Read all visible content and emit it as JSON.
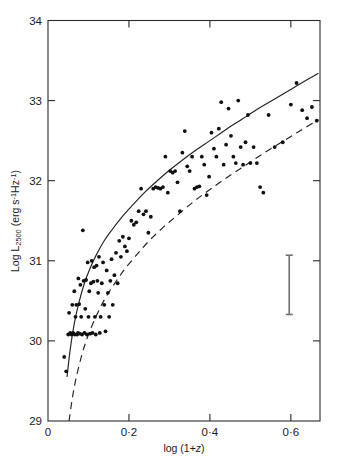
{
  "chart_data": {
    "type": "scatter",
    "title": "",
    "xlabel": "log (1+z)",
    "ylabel": "Log L_2500 (erg s^-1 Hz^-1)",
    "xlabel_parts": {
      "prefix": "log (1+",
      "italic": "z",
      "suffix": ")"
    },
    "ylabel_parts": {
      "lead": "Log L",
      "subscript": "2500",
      "open": " (erg s",
      "exp1": "-1",
      "mid": "Hz",
      "exp2": "-1",
      "close": ")"
    },
    "xlim": [
      0.0,
      0.672
    ],
    "ylim": [
      29.0,
      34.0
    ],
    "xticks": [
      0.0,
      0.2,
      0.4,
      0.6
    ],
    "xticklabels": [
      "0",
      "0·2",
      "0·4",
      "0·6"
    ],
    "yticks": [
      29,
      30,
      31,
      32,
      33,
      34
    ],
    "yticklabels": [
      "29",
      "30",
      "31",
      "32",
      "33",
      "34"
    ],
    "grid": false,
    "legend_position": "none",
    "tick_direction": "in",
    "axes_box": true,
    "point_marker": "filled-circle",
    "point_radius_px": 1.9,
    "series": [
      {
        "name": "quasar sample",
        "x": [
          0.04,
          0.045,
          0.05,
          0.052,
          0.055,
          0.058,
          0.06,
          0.062,
          0.063,
          0.065,
          0.066,
          0.068,
          0.07,
          0.072,
          0.074,
          0.075,
          0.077,
          0.078,
          0.08,
          0.082,
          0.084,
          0.086,
          0.088,
          0.09,
          0.092,
          0.094,
          0.096,
          0.098,
          0.1,
          0.102,
          0.104,
          0.106,
          0.108,
          0.11,
          0.112,
          0.114,
          0.116,
          0.118,
          0.12,
          0.122,
          0.124,
          0.126,
          0.128,
          0.13,
          0.133,
          0.136,
          0.139,
          0.142,
          0.145,
          0.148,
          0.151,
          0.154,
          0.157,
          0.16,
          0.164,
          0.168,
          0.172,
          0.176,
          0.18,
          0.185,
          0.19,
          0.195,
          0.2,
          0.206,
          0.212,
          0.218,
          0.224,
          0.23,
          0.236,
          0.242,
          0.248,
          0.254,
          0.26,
          0.266,
          0.272,
          0.278,
          0.284,
          0.29,
          0.296,
          0.302,
          0.308,
          0.314,
          0.32,
          0.326,
          0.332,
          0.338,
          0.344,
          0.35,
          0.356,
          0.362,
          0.368,
          0.374,
          0.38,
          0.386,
          0.392,
          0.398,
          0.404,
          0.41,
          0.416,
          0.422,
          0.428,
          0.434,
          0.44,
          0.446,
          0.452,
          0.458,
          0.464,
          0.47,
          0.476,
          0.482,
          0.488,
          0.494,
          0.5,
          0.508,
          0.516,
          0.524,
          0.532,
          0.545,
          0.56,
          0.58,
          0.6,
          0.614,
          0.628,
          0.64,
          0.652,
          0.664
        ],
        "y": [
          29.8,
          29.62,
          30.08,
          30.35,
          30.1,
          30.08,
          30.45,
          30.1,
          30.09,
          30.62,
          30.08,
          30.3,
          30.45,
          30.08,
          30.1,
          30.78,
          30.46,
          30.09,
          30.7,
          30.3,
          30.08,
          31.38,
          30.75,
          30.1,
          30.4,
          30.76,
          30.08,
          30.98,
          30.3,
          30.62,
          30.09,
          30.72,
          31.0,
          30.1,
          30.74,
          30.92,
          30.3,
          30.08,
          30.94,
          30.75,
          30.6,
          31.05,
          30.1,
          30.3,
          30.72,
          30.98,
          30.45,
          30.12,
          30.88,
          30.6,
          30.3,
          30.75,
          31.02,
          30.45,
          30.82,
          31.1,
          30.72,
          31.25,
          31.05,
          31.3,
          31.18,
          31.12,
          31.28,
          31.5,
          31.45,
          31.48,
          31.62,
          31.9,
          31.58,
          31.62,
          31.35,
          31.55,
          31.9,
          31.92,
          31.91,
          31.9,
          31.92,
          32.3,
          31.85,
          32.12,
          32.1,
          32.12,
          31.98,
          31.62,
          32.35,
          32.62,
          32.18,
          32.12,
          32.3,
          31.9,
          31.92,
          31.93,
          32.3,
          32.2,
          31.82,
          32.05,
          32.6,
          32.4,
          32.3,
          32.65,
          32.98,
          32.2,
          32.45,
          32.9,
          32.56,
          32.3,
          32.22,
          33.0,
          32.42,
          32.2,
          32.48,
          32.82,
          32.22,
          32.42,
          32.22,
          31.92,
          31.85,
          32.82,
          32.42,
          32.48,
          32.95,
          33.22,
          32.88,
          32.78,
          32.92,
          32.75
        ]
      }
    ],
    "curves": [
      {
        "name": "solid-model-curve",
        "style": "solid",
        "x": [
          0.047,
          0.055,
          0.065,
          0.075,
          0.09,
          0.105,
          0.12,
          0.14,
          0.16,
          0.185,
          0.21,
          0.24,
          0.27,
          0.3,
          0.33,
          0.365,
          0.4,
          0.44,
          0.48,
          0.52,
          0.56,
          0.6,
          0.64,
          0.668
        ],
        "y": [
          29.55,
          29.9,
          30.22,
          30.45,
          30.72,
          30.92,
          31.08,
          31.26,
          31.4,
          31.56,
          31.7,
          31.86,
          32.0,
          32.13,
          32.25,
          32.38,
          32.5,
          32.64,
          32.77,
          32.9,
          33.02,
          33.14,
          33.26,
          33.34
        ]
      },
      {
        "name": "dashed-model-curve",
        "style": "dashed",
        "x": [
          0.052,
          0.06,
          0.07,
          0.085,
          0.1,
          0.12,
          0.14,
          0.165,
          0.19,
          0.22,
          0.25,
          0.285,
          0.32,
          0.36,
          0.4,
          0.445,
          0.49,
          0.535,
          0.58,
          0.625,
          0.668
        ],
        "y": [
          29.0,
          29.28,
          29.55,
          29.85,
          30.08,
          30.32,
          30.52,
          30.72,
          30.9,
          31.08,
          31.25,
          31.42,
          31.57,
          31.74,
          31.89,
          32.05,
          32.2,
          32.35,
          32.49,
          32.63,
          32.76
        ]
      }
    ],
    "error_bar": {
      "name": "typical-error-bar",
      "x": 0.596,
      "y_center": 30.7,
      "y_low": 30.33,
      "y_high": 31.07,
      "half_length_dex": 0.37
    }
  },
  "colors": {
    "axis": "#2b2b2b",
    "curve": "#222222",
    "point": "#101010",
    "errorbar": "#6f6f6f",
    "background": "#ffffff"
  }
}
